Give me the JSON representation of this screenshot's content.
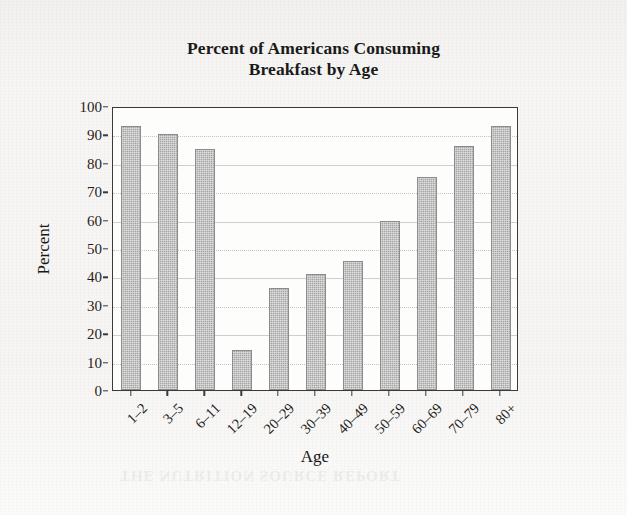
{
  "chart_data": {
    "type": "bar",
    "title": "Percent of Americans Consuming Breakfast by Age",
    "title_line1": "Percent of Americans Consuming",
    "title_line2": "Breakfast by Age",
    "xlabel": "Age",
    "ylabel": "Percent",
    "categories": [
      "1–2",
      "3–5",
      "6–11",
      "12–19",
      "20–29",
      "30–39",
      "40–49",
      "50–59",
      "60–69",
      "70–79",
      "80+"
    ],
    "values": [
      93,
      90,
      85,
      14,
      36,
      41,
      45.5,
      59.5,
      75,
      86,
      93
    ],
    "ylim": [
      0,
      100
    ],
    "ytick_values": [
      0,
      10,
      20,
      30,
      40,
      50,
      60,
      70,
      80,
      90,
      100
    ],
    "ytick_labels": [
      "0",
      "10",
      "20",
      "30",
      "40",
      "50",
      "60",
      "70",
      "80",
      "90",
      "100"
    ],
    "grid": true,
    "grid_axis": "y",
    "legend": false,
    "bar_color": "#a9a9a9",
    "bar_edge_color": "#8c8c8c",
    "axis_color": "#3a3a3a",
    "grid_color": "#cfcfcf",
    "background_color": "#f6f5f3",
    "plot_background_color": "#fdfdfc",
    "text_color": "#1a1a1a",
    "xtick_rotation": -45
  },
  "figure": {
    "bleed_text": "THE NUTRITION SOURCE REPORT"
  }
}
